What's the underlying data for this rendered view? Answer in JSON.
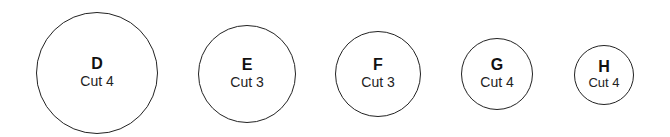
{
  "diagram": {
    "circles": [
      {
        "letter": "D",
        "label": "Cut 4",
        "cx": 97,
        "cy": 73,
        "r": 61
      },
      {
        "letter": "E",
        "label": "Cut 3",
        "cx": 247,
        "cy": 74,
        "r": 49
      },
      {
        "letter": "F",
        "label": "Cut 3",
        "cx": 378,
        "cy": 74,
        "r": 43
      },
      {
        "letter": "G",
        "label": "Cut 4",
        "cx": 497,
        "cy": 74,
        "r": 36
      },
      {
        "letter": "H",
        "label": "Cut 4",
        "cx": 604,
        "cy": 75,
        "r": 30
      }
    ]
  }
}
